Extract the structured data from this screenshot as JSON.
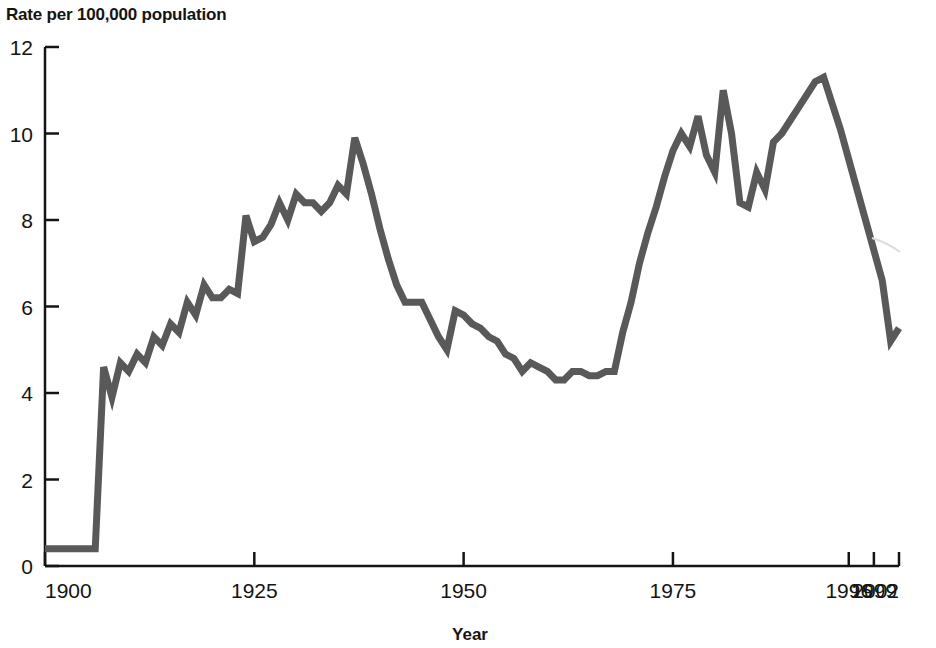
{
  "chart_data": {
    "type": "line",
    "title": "Rate per 100,000 population",
    "xlabel": "Year",
    "ylabel": "Rate per 100,000 population",
    "ylim": [
      0,
      12
    ],
    "xlim": [
      1900,
      2002
    ],
    "grid": false,
    "legend": "none",
    "y_ticks": [
      "0",
      "2",
      "4",
      "6",
      "8",
      "10",
      "12"
    ],
    "y_tick_values": [
      0,
      2,
      4,
      6,
      8,
      10,
      12
    ],
    "x_ticks": [
      "1900",
      "1925",
      "1950",
      "1975",
      "1996",
      "1999",
      "2002"
    ],
    "x_tick_values": [
      1900,
      1925,
      1950,
      1975,
      1996,
      1999,
      2002
    ],
    "series": [
      {
        "name": "Rate per 100,000 population",
        "color": "#595959",
        "x": [
          1900,
          1901,
          1902,
          1903,
          1904,
          1905,
          1906,
          1907,
          1908,
          1909,
          1910,
          1911,
          1912,
          1913,
          1914,
          1915,
          1916,
          1917,
          1918,
          1919,
          1920,
          1921,
          1922,
          1923,
          1924,
          1925,
          1926,
          1927,
          1928,
          1929,
          1930,
          1931,
          1932,
          1933,
          1934,
          1935,
          1936,
          1937,
          1938,
          1939,
          1940,
          1941,
          1942,
          1943,
          1944,
          1945,
          1946,
          1947,
          1948,
          1949,
          1950,
          1951,
          1952,
          1953,
          1954,
          1955,
          1956,
          1957,
          1958,
          1959,
          1960,
          1961,
          1962,
          1963,
          1964,
          1965,
          1966,
          1967,
          1968,
          1969,
          1970,
          1971,
          1972,
          1973,
          1974,
          1975,
          1976,
          1977,
          1978,
          1979,
          1980,
          1981,
          1982,
          1983,
          1984,
          1985,
          1986,
          1987,
          1988,
          1989,
          1990,
          1991,
          1992,
          1993,
          1994,
          1995,
          1996,
          1997,
          1998,
          1999,
          2000,
          2001,
          2002
        ],
        "y": [
          0.4,
          0.4,
          0.4,
          0.4,
          0.4,
          0.4,
          0.4,
          4.6,
          3.9,
          4.7,
          4.5,
          4.9,
          4.7,
          5.3,
          5.1,
          5.6,
          5.4,
          6.1,
          5.8,
          6.5,
          6.2,
          6.2,
          6.4,
          6.3,
          8.1,
          7.5,
          7.6,
          7.9,
          8.4,
          8.0,
          8.6,
          8.4,
          8.4,
          8.2,
          8.4,
          8.8,
          8.6,
          9.9,
          9.3,
          8.6,
          7.8,
          7.1,
          6.5,
          6.1,
          6.1,
          6.1,
          5.7,
          5.3,
          5.0,
          5.9,
          5.8,
          5.6,
          5.5,
          5.3,
          5.2,
          4.9,
          4.8,
          4.5,
          4.7,
          4.6,
          4.5,
          4.3,
          4.3,
          4.5,
          4.5,
          4.4,
          4.4,
          4.5,
          4.5,
          5.4,
          6.1,
          7.0,
          7.7,
          8.3,
          9.0,
          9.6,
          10.0,
          9.7,
          10.4,
          9.5,
          9.1,
          11.0,
          10.0,
          8.4,
          8.3,
          9.1,
          8.7,
          9.8,
          10.0,
          10.3,
          10.6,
          10.9,
          11.2,
          11.3,
          10.7,
          10.1,
          9.4,
          8.7,
          8.0,
          7.3,
          6.6,
          5.2,
          5.5
        ]
      }
    ]
  },
  "axis": {
    "y_axis_name": "y-axis",
    "x_axis_name": "x-axis"
  }
}
